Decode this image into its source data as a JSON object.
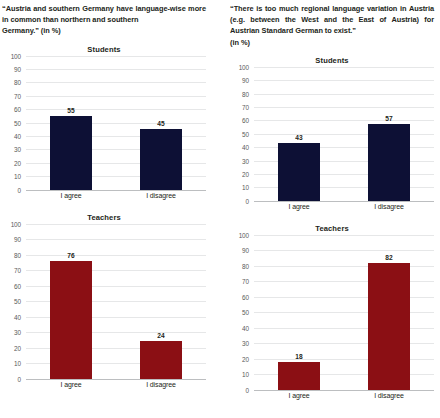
{
  "chart_data": [
    {
      "id": "left-students",
      "type": "bar",
      "title": "Students",
      "question": "“Austria and southern Germany have language-wise more in common than northern and southern Germany.” (in %)",
      "categories": [
        "I agree",
        "I disagree"
      ],
      "values": [
        55,
        45
      ],
      "bar_color": "#0d1035",
      "xlabel": "",
      "ylabel": "",
      "ylim": [
        0,
        100
      ],
      "yticks": [
        0,
        10,
        20,
        30,
        40,
        50,
        60,
        70,
        80,
        90,
        100
      ],
      "grid": true,
      "legend": "none"
    },
    {
      "id": "left-teachers",
      "type": "bar",
      "title": "Teachers",
      "question": "“Austria and southern Germany have language-wise more in common than northern and southern Germany.” (in %)",
      "categories": [
        "I agree",
        "I disagree"
      ],
      "values": [
        76,
        24
      ],
      "bar_color": "#8b0f14",
      "xlabel": "",
      "ylabel": "",
      "ylim": [
        0,
        100
      ],
      "yticks": [
        0,
        10,
        20,
        30,
        40,
        50,
        60,
        70,
        80,
        90,
        100
      ],
      "grid": true,
      "legend": "none"
    },
    {
      "id": "right-students",
      "type": "bar",
      "title": "Students",
      "question": "“There is too much regional language variation in Austria (e.g. between the West and the East of Austria) for Austrian Standard German to exist.” (in %)",
      "categories": [
        "I agree",
        "I disagree"
      ],
      "values": [
        43,
        57
      ],
      "bar_color": "#0d1035",
      "xlabel": "",
      "ylabel": "",
      "ylim": [
        0,
        100
      ],
      "yticks": [
        0,
        10,
        20,
        30,
        40,
        50,
        60,
        70,
        80,
        90,
        100
      ],
      "grid": true,
      "legend": "none"
    },
    {
      "id": "right-teachers",
      "type": "bar",
      "title": "Teachers",
      "question": "“There is too much regional language variation in Austria (e.g. between the West and the East of Austria) for Austrian Standard German to exist.” (in %)",
      "categories": [
        "I agree",
        "I disagree"
      ],
      "values": [
        18,
        82
      ],
      "bar_color": "#8b0f14",
      "xlabel": "",
      "ylabel": "",
      "ylim": [
        0,
        100
      ],
      "yticks": [
        0,
        10,
        20,
        30,
        40,
        50,
        60,
        70,
        80,
        90,
        100
      ],
      "grid": true,
      "legend": "none"
    }
  ],
  "columns": [
    {
      "caption_main": "“Austria and southern Germany have language-wise more in common than northern and southern",
      "caption_last": "Germany.” (in %)",
      "charts": [
        "left-students",
        "left-teachers"
      ]
    },
    {
      "caption_main": "“There is too much regional language variation in Austria (e.g. between the West and the East of Austria) for Austrian Standard German to exist.”",
      "caption_last": "(in %)",
      "charts": [
        "right-students",
        "right-teachers"
      ]
    }
  ],
  "colors": {
    "students_bar": "#0d1035",
    "teachers_bar": "#8b0f14",
    "gridline": "#e6e7e8",
    "baseline": "#bcbec0",
    "tick_text": "#58595b",
    "body_text": "#231f20",
    "background": "#ffffff"
  }
}
